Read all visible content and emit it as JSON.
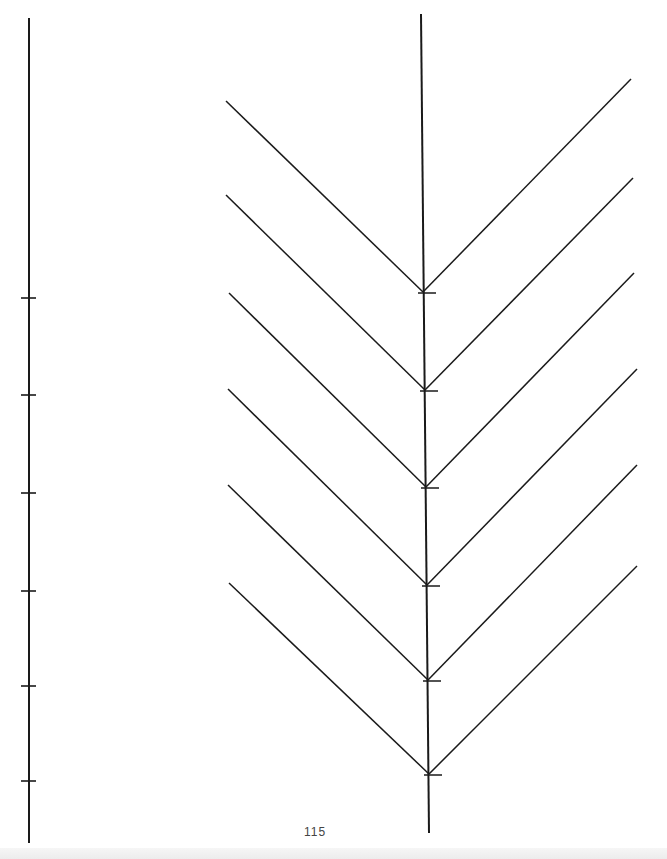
{
  "page": {
    "number": "115",
    "stroke_color": "#1a1a1a"
  },
  "left_axis": {
    "x": 29,
    "y_top": 18,
    "y_bottom": 843,
    "ticks_y": [
      298,
      395,
      493,
      591,
      686,
      781
    ]
  },
  "tree": {
    "trunk": {
      "x_top": 421,
      "y_top": 14,
      "x_bottom": 429,
      "y_bottom": 833
    },
    "chevrons": [
      {
        "vertex": [
          423,
          292
        ],
        "left": [
          226,
          101
        ],
        "right": [
          631,
          79
        ]
      },
      {
        "vertex": [
          425,
          390
        ],
        "left": [
          226,
          195
        ],
        "right": [
          633,
          178
        ]
      },
      {
        "vertex": [
          426,
          487
        ],
        "left": [
          229,
          293
        ],
        "right": [
          634,
          273
        ]
      },
      {
        "vertex": [
          427,
          585
        ],
        "left": [
          228,
          389
        ],
        "right": [
          637,
          369
        ]
      },
      {
        "vertex": [
          428,
          680
        ],
        "left": [
          228,
          485
        ],
        "right": [
          637,
          465
        ]
      },
      {
        "vertex": [
          429,
          774
        ],
        "left": [
          229,
          583
        ],
        "right": [
          637,
          566
        ]
      }
    ]
  }
}
